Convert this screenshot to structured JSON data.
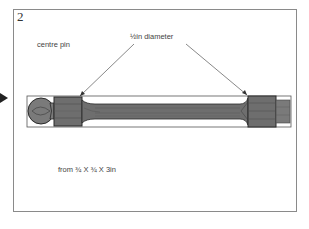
{
  "figure": {
    "step_number": "2",
    "title": "centre pin",
    "annotation": "½in diameter",
    "stock_size": "from ¾ X ¾ X 3in"
  },
  "colors": {
    "frame": "#8a8a8a",
    "wood": "#6e6e6e",
    "wood_dark": "#4f4f4f",
    "outline": "#2a2a2a",
    "text": "#444444"
  },
  "icons": {
    "pointer": "triangle-right-icon"
  }
}
